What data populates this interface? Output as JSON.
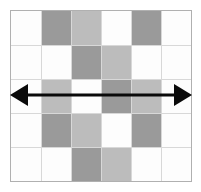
{
  "figure": {
    "title": "Quilt square with horizontal line of symmetry",
    "frame": {
      "x": 10,
      "y": 10,
      "width": 182,
      "height": 172,
      "border_color": "#b0b0b0"
    },
    "palette": {
      "white": "#fdfdfd",
      "light_gray": "#bcbcbc",
      "dark_gray": "#9a9a9a",
      "seam": "#d8d8d8",
      "arrow": "#0a0a0a",
      "background": "#ffffff"
    },
    "grid": {
      "columns": 6,
      "rows": 5,
      "cells": [
        [
          "white",
          "dark_gray",
          "light_gray",
          "white",
          "dark_gray",
          "white"
        ],
        [
          "white",
          "white",
          "dark_gray",
          "light_gray",
          "white",
          "white"
        ],
        [
          "white",
          "light_gray",
          "white",
          "dark_gray",
          "light_gray",
          "white"
        ],
        [
          "white",
          "dark_gray",
          "light_gray",
          "white",
          "dark_gray",
          "white"
        ],
        [
          "white",
          "white",
          "dark_gray",
          "light_gray",
          "white",
          "white"
        ]
      ]
    },
    "arrow": {
      "label": "horizontal line of symmetry",
      "orientation": "horizontal",
      "double_headed": true,
      "x_start": 10,
      "x_end": 192,
      "y": 95,
      "line_width": 3,
      "head_length": 18,
      "head_half_height": 11,
      "color": "#0a0a0a"
    }
  }
}
